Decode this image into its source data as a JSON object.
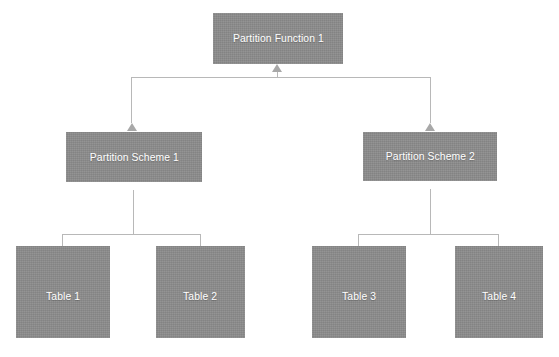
{
  "diagram": {
    "type": "tree",
    "canvas": {
      "width": 559,
      "height": 357,
      "background": "#ffffff"
    },
    "style": {
      "node_fill": "#8c8c8c",
      "node_text_color": "#ffffff",
      "connector_color": "#b8b8b8",
      "arrow_color": "#a8a8a8"
    },
    "nodes": [
      {
        "id": "partition-function-1",
        "label": "Partition Function 1",
        "level": "function",
        "x": 213,
        "y": 13,
        "w": 130,
        "h": 51
      },
      {
        "id": "partition-scheme-1",
        "label": "Partition Scheme 1",
        "level": "scheme",
        "x": 66,
        "y": 132,
        "w": 136,
        "h": 50
      },
      {
        "id": "partition-scheme-2",
        "label": "Partition Scheme 2",
        "level": "scheme",
        "x": 363,
        "y": 132,
        "w": 134,
        "h": 49
      },
      {
        "id": "table-1",
        "label": "Table 1",
        "level": "table",
        "x": 16,
        "y": 246,
        "w": 94,
        "h": 92
      },
      {
        "id": "table-2",
        "label": "Table 2",
        "level": "table",
        "x": 156,
        "y": 246,
        "w": 89,
        "h": 92
      },
      {
        "id": "table-3",
        "label": "Table 3",
        "level": "table",
        "x": 312,
        "y": 246,
        "w": 94,
        "h": 92
      },
      {
        "id": "table-4",
        "label": "Table 4",
        "level": "table",
        "x": 455,
        "y": 246,
        "w": 88,
        "h": 92
      }
    ],
    "edges": [
      {
        "from": "partition-scheme-1",
        "to": "partition-function-1"
      },
      {
        "from": "partition-scheme-2",
        "to": "partition-function-1"
      },
      {
        "from": "table-1",
        "to": "partition-scheme-1"
      },
      {
        "from": "table-2",
        "to": "partition-scheme-1"
      },
      {
        "from": "table-3",
        "to": "partition-scheme-2"
      },
      {
        "from": "table-4",
        "to": "partition-scheme-2"
      }
    ]
  }
}
